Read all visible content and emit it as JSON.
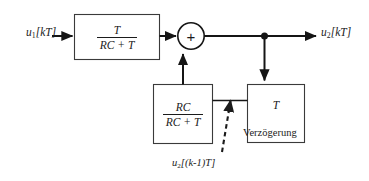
{
  "diagram": {
    "type": "block-diagram",
    "colors": {
      "background": "#ffffff",
      "line": "#151515",
      "block_border": "#3a3a3a",
      "text": "#1b1b1b",
      "dashed_line": "#1b1b1b"
    },
    "input": {
      "label_plain": "u1[kT]",
      "var": "u",
      "subscript": "1",
      "argument": "[kT]"
    },
    "output": {
      "label_plain": "u2[kT]",
      "var": "u",
      "subscript": "2",
      "argument": "[kT]"
    },
    "blocks": [
      {
        "id": "forward-gain",
        "name": "forward-gain-block",
        "kind": "fraction",
        "numerator": "T",
        "denominator": "RC + T",
        "label_plain": "T / (RC + T)"
      },
      {
        "id": "feedback-gain",
        "name": "feedback-gain-block",
        "kind": "fraction",
        "numerator": "RC",
        "denominator": "RC + T",
        "label_plain": "RC / (RC + T)"
      },
      {
        "id": "delay",
        "name": "delay-block",
        "kind": "plain",
        "label": "T",
        "label_plain": "T"
      }
    ],
    "summation": {
      "name": "summation-node",
      "sign": "+"
    },
    "junction": {
      "name": "signal-junction-dot"
    },
    "annotations": [
      {
        "id": "delay-annotation",
        "text": "Verzögerung"
      },
      {
        "id": "feedback-signal",
        "var": "u",
        "subscript": "2",
        "argument": "[(k-1)T]",
        "text_plain": "u2[(k-1)T]"
      }
    ]
  }
}
